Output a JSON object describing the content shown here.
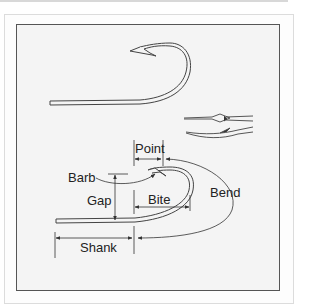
{
  "figure": {
    "labels": {
      "point": "Point",
      "barb": "Barb",
      "gap": "Gap",
      "bite": "Bite",
      "bend": "Bend",
      "shank": "Shank"
    },
    "views": [
      "full-hook-side-view",
      "point-detail-top-view",
      "point-detail-side-view",
      "labeled-hook"
    ],
    "colors": {
      "line": "#333333",
      "panel_background": "#f4f4f4",
      "panel_border": "#555555"
    }
  }
}
